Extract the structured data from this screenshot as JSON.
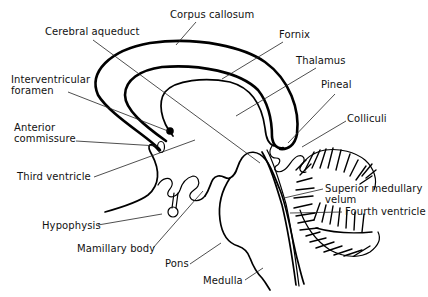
{
  "diagram": {
    "type": "anatomical-labeled-diagram",
    "colors": {
      "line": "#000000",
      "background": "#ffffff",
      "text": "#111111"
    },
    "labels": [
      {
        "id": "corpus-callosum",
        "text": "Corpus callosum",
        "x": 170,
        "y": 18,
        "anchor": "start",
        "leader": [
          [
            196,
            22
          ],
          [
            176,
            45
          ]
        ]
      },
      {
        "id": "cerebral-aqueduct",
        "text": "Cerebral aqueduct",
        "x": 45,
        "y": 35,
        "anchor": "start",
        "leader": [
          [
            93,
            40
          ],
          [
            260,
            163
          ]
        ]
      },
      {
        "id": "fornix",
        "text": "Fornix",
        "x": 279,
        "y": 38,
        "anchor": "start",
        "leader": [
          [
            283,
            42
          ],
          [
            222,
            79
          ]
        ]
      },
      {
        "id": "thalamus",
        "text": "Thalamus",
        "x": 296,
        "y": 64,
        "anchor": "start",
        "leader": [
          [
            316,
            68
          ],
          [
            236,
            116
          ]
        ]
      },
      {
        "id": "interventricular-foramen-1",
        "text": "Interventricular",
        "x": 11,
        "y": 83,
        "anchor": "start",
        "leader": null
      },
      {
        "id": "interventricular-foramen-2",
        "text": "foramen",
        "x": 11,
        "y": 94,
        "anchor": "start",
        "leader": [
          [
            68,
            92
          ],
          [
            168,
            131
          ]
        ]
      },
      {
        "id": "pineal",
        "text": "Pineal",
        "x": 321,
        "y": 88,
        "anchor": "start",
        "leader": [
          [
            335,
            94
          ],
          [
            288,
            143
          ]
        ]
      },
      {
        "id": "colliculi",
        "text": "Colliculi",
        "x": 347,
        "y": 122,
        "anchor": "start",
        "leader": [
          [
            346,
            121
          ],
          [
            302,
            147
          ]
        ]
      },
      {
        "id": "anterior-commissure-1",
        "text": "Anterior",
        "x": 14,
        "y": 131,
        "anchor": "start",
        "leader": null
      },
      {
        "id": "anterior-commissure-2",
        "text": "commissure",
        "x": 14,
        "y": 142,
        "anchor": "start",
        "leader": [
          [
            76,
            141
          ],
          [
            158,
            146
          ]
        ]
      },
      {
        "id": "third-ventricle",
        "text": "Third ventricle",
        "x": 17,
        "y": 180,
        "anchor": "start",
        "leader": [
          [
            94,
            177
          ],
          [
            195,
            140
          ]
        ]
      },
      {
        "id": "superior-medullary-velum-1",
        "text": "Superior medullary",
        "x": 325,
        "y": 192,
        "anchor": "start",
        "leader": [
          [
            323,
            189
          ],
          [
            284,
            198
          ]
        ]
      },
      {
        "id": "superior-medullary-velum-2",
        "text": "velum",
        "x": 325,
        "y": 203,
        "anchor": "start",
        "leader": null
      },
      {
        "id": "fourth-ventricle",
        "text": "Fourth ventricle",
        "x": 345,
        "y": 215,
        "anchor": "start",
        "leader": [
          [
            342,
            212
          ],
          [
            290,
            213
          ]
        ]
      },
      {
        "id": "hypophysis",
        "text": "Hypophysis",
        "x": 42,
        "y": 229,
        "anchor": "start",
        "leader": [
          [
            98,
            225
          ],
          [
            162,
            214
          ]
        ]
      },
      {
        "id": "mamillary-body",
        "text": "Mamillary body",
        "x": 77,
        "y": 252,
        "anchor": "start",
        "leader": [
          [
            153,
            248
          ],
          [
            203,
            191
          ]
        ]
      },
      {
        "id": "pons",
        "text": "Pons",
        "x": 165,
        "y": 267,
        "anchor": "start",
        "leader": [
          [
            190,
            264
          ],
          [
            221,
            243
          ]
        ]
      },
      {
        "id": "medulla",
        "text": "Medulla",
        "x": 203,
        "y": 284,
        "anchor": "start",
        "leader": [
          [
            245,
            280
          ],
          [
            263,
            268
          ]
        ]
      }
    ]
  }
}
